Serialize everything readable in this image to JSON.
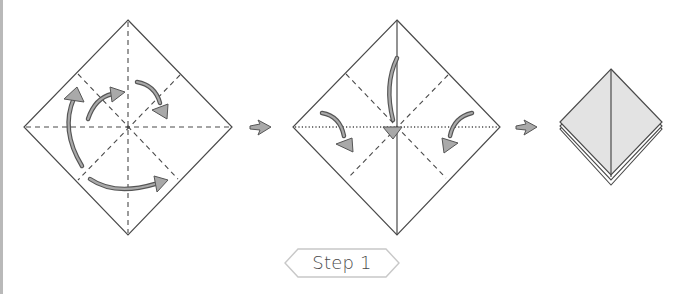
{
  "diagram": {
    "step_label": "Step 1",
    "colors": {
      "line": "#4a4a4a",
      "arrow_fill": "#a9a9a9",
      "arrow_stroke": "#555555",
      "paper_shaded": "#e3e3e3",
      "label_border": "#c8c8c8",
      "page_border": "#b9b9b9"
    },
    "panels": [
      {
        "id": "panel-1",
        "description": "Square paper rotated as diamond with valley/mountain creases; curved arrows indicate folding"
      },
      {
        "id": "panel-2",
        "description": "Diamond with center vertical fold; arrows show collapsing sides inward to center"
      },
      {
        "id": "panel-3",
        "description": "Result: preliminary base (square base), layered diamond"
      }
    ],
    "transition_arrows": 2
  }
}
